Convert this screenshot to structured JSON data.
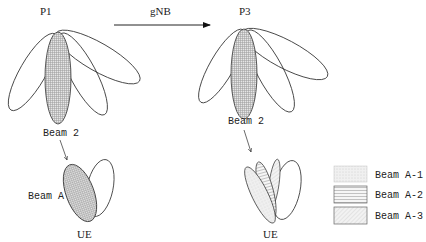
{
  "diagram": {
    "left_panel": {
      "title": "P1",
      "beam_label": "Beam 2",
      "ue_beam_label": "Beam A",
      "ue_label": "UE"
    },
    "right_panel": {
      "title": "P3",
      "beam_label": "Beam 2",
      "ue_label": "UE"
    },
    "transition_arrow": {
      "label": "gNB"
    },
    "legend": {
      "items": [
        {
          "label": "Beam A-1",
          "pattern": "dotted-fill"
        },
        {
          "label": "Beam A-2",
          "pattern": "horizontal-lines"
        },
        {
          "label": "Beam A-3",
          "pattern": "diagonal-hatch"
        }
      ]
    },
    "colors": {
      "stroke": "#333333",
      "shade": "#c8c8c8",
      "background": "#ffffff"
    }
  }
}
